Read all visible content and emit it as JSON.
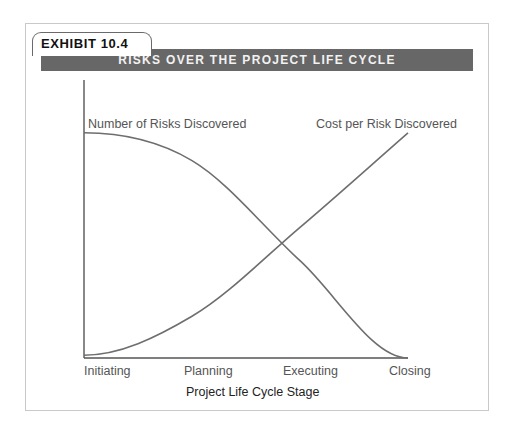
{
  "exhibit": {
    "tab_label": "EXHIBIT 10.4",
    "title": "RISKS OVER THE PROJECT LIFE CYCLE"
  },
  "chart_data": {
    "type": "line",
    "title": "RISKS OVER THE PROJECT LIFE CYCLE",
    "xlabel": "Project Life Cycle Stage",
    "ylabel": "",
    "categories": [
      "Initiating",
      "Planning",
      "Executing",
      "Closing"
    ],
    "series": [
      {
        "name": "Number of Risks Discovered",
        "values": [
          81,
          71,
          35,
          0
        ]
      },
      {
        "name": "Cost per Risk Discovered",
        "values": [
          1,
          15,
          47,
          81
        ]
      }
    ],
    "ylim": [
      0,
      100
    ],
    "grid": false,
    "legend": "inline labels near curve ends"
  },
  "colors": {
    "band": "#676767",
    "curve": "#6e6e6e",
    "axis": "#555555",
    "label_text": "#555555",
    "axis_title_text": "#222222"
  }
}
